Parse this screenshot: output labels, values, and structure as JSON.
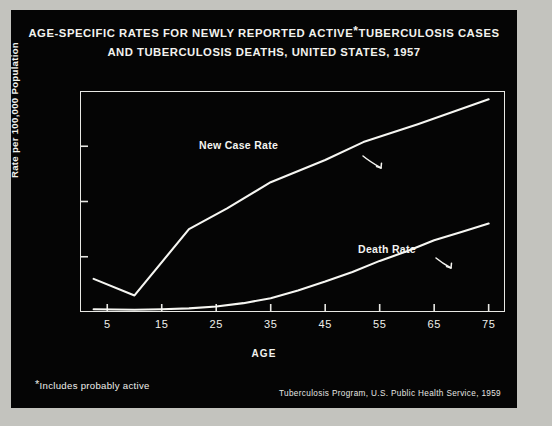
{
  "chart_data": {
    "type": "line",
    "title_line1": "AGE-SPECIFIC RATES FOR NEWLY REPORTED ACTIVE",
    "title_asterisk": "*",
    "title_line1_cont": "TUBERCULOSIS CASES",
    "title_line2": "AND TUBERCULOSIS DEATHS, UNITED STATES, 1957",
    "xlabel": "AGE",
    "ylabel": "Rate per 100,000 Population",
    "xlim": [
      0,
      78
    ],
    "ylim": [
      0,
      80
    ],
    "xticks": [
      5,
      15,
      25,
      35,
      45,
      55,
      65,
      75
    ],
    "xtick_labels": [
      "5",
      "15",
      "25",
      "35",
      "45",
      "55",
      "65",
      "75"
    ],
    "yticks": [
      0,
      20,
      40,
      60,
      80
    ],
    "ytick_labels": [
      "0",
      "20",
      "40",
      "60",
      "80"
    ],
    "grid": false,
    "legend_position": "inline-annotation",
    "series": [
      {
        "name": "New Case Rate",
        "label": "New Case Rate",
        "x": [
          2.5,
          10,
          20,
          27,
          35,
          45,
          52,
          62,
          75
        ],
        "values": [
          12.0,
          6.0,
          30.0,
          37.5,
          47.0,
          55.0,
          61.5,
          68.0,
          77.0
        ]
      },
      {
        "name": "Death Rate",
        "label": "Death Rate",
        "x": [
          2.5,
          10,
          15,
          20,
          25,
          30,
          35,
          40,
          45,
          50,
          55,
          60,
          65,
          70,
          75
        ],
        "values": [
          1.0,
          0.8,
          1.0,
          1.3,
          2.0,
          3.2,
          5.0,
          7.8,
          11.0,
          14.5,
          18.5,
          22.0,
          26.0,
          29.0,
          32.0
        ]
      }
    ],
    "annotations": [
      {
        "text": "New Case Rate",
        "x": 32,
        "y": 62
      },
      {
        "text": "Death Rate",
        "x": 48,
        "y": 26
      }
    ]
  },
  "footnote": {
    "marker": "*",
    "text": "Includes probably active"
  },
  "source": {
    "text": "Tuberculosis Program, U.S. Public Health Service, 1959"
  },
  "colors": {
    "background": "#050505",
    "ink": "#f2f2ee",
    "photo_border": "#c3c3be"
  }
}
